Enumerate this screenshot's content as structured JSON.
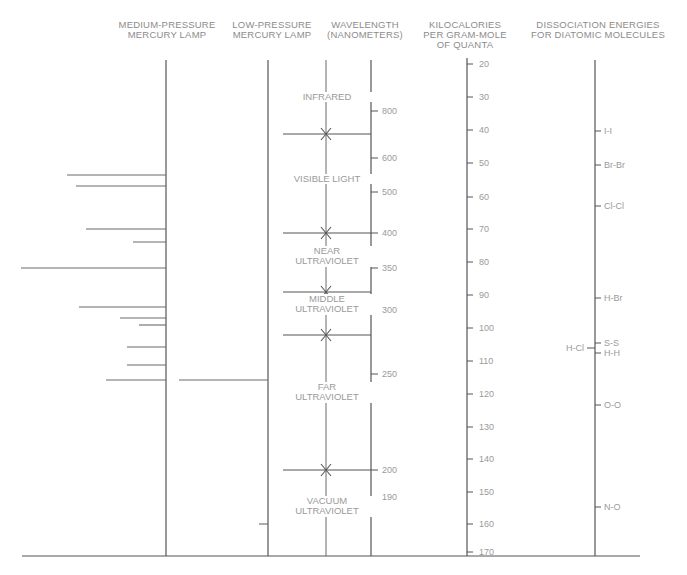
{
  "headers": {
    "medium_pressure": "MEDIUM-PRESSURE\nMERCURY LAMP",
    "low_pressure": "LOW-PRESSURE\nMERCURY LAMP",
    "wavelength": "WAVELENGTH\n(NANOMETERS)",
    "kilocalories": "KILOCALORIES\nPER GRAM-MOLE\nOF QUANTA",
    "dissociation": "DISSOCIATION ENERGIES\nFOR DIATOMIC MOLECULES"
  },
  "regions": [
    {
      "label": "INFRARED",
      "y": 97
    },
    {
      "label": "VISIBLE LIGHT",
      "y": 179
    },
    {
      "label": "NEAR\nULTRAVIOLET",
      "y": 256
    },
    {
      "label": "MIDDLE\nULTRAVIOLET",
      "y": 304
    },
    {
      "label": "FAR\nULTRAVIOLET",
      "y": 392
    },
    {
      "label": "VACUUM\nULTRAVIOLET",
      "y": 506
    }
  ],
  "region_boundaries_y": [
    134,
    233,
    292,
    335,
    470
  ],
  "chart_data": {
    "type": "diagram",
    "wavelength_axis": {
      "label": "WAVELENGTH (NANOMETERS)",
      "ticks": [
        {
          "value": 800,
          "y": 111
        },
        {
          "value": 600,
          "y": 158
        },
        {
          "value": 500,
          "y": 192
        },
        {
          "value": 400,
          "y": 233
        },
        {
          "value": 350,
          "y": 268
        },
        {
          "value": 300,
          "y": 310
        },
        {
          "value": 250,
          "y": 374
        },
        {
          "value": 200,
          "y": 470
        },
        {
          "value": 190,
          "y": 497
        }
      ]
    },
    "energy_axis": {
      "label": "KILOCALORIES PER GRAM-MOLE OF QUANTA",
      "ticks": [
        {
          "value": 20,
          "y": 64
        },
        {
          "value": 30,
          "y": 97
        },
        {
          "value": 40,
          "y": 130
        },
        {
          "value": 50,
          "y": 163
        },
        {
          "value": 60,
          "y": 197
        },
        {
          "value": 70,
          "y": 229
        },
        {
          "value": 80,
          "y": 262
        },
        {
          "value": 90,
          "y": 295
        },
        {
          "value": 100,
          "y": 328
        },
        {
          "value": 110,
          "y": 361
        },
        {
          "value": 120,
          "y": 394
        },
        {
          "value": 130,
          "y": 427
        },
        {
          "value": 140,
          "y": 459
        },
        {
          "value": 150,
          "y": 492
        },
        {
          "value": 160,
          "y": 524
        },
        {
          "value": 170,
          "y": 552
        }
      ]
    },
    "dissociation_energies": [
      {
        "molecule": "I-I",
        "kcal": 36,
        "y": 131,
        "side": "right"
      },
      {
        "molecule": "Br-Br",
        "kcal": 46,
        "y": 165,
        "side": "right"
      },
      {
        "molecule": "Cl-Cl",
        "kcal": 58,
        "y": 206,
        "side": "right"
      },
      {
        "molecule": "H-Br",
        "kcal": 87,
        "y": 298,
        "side": "right"
      },
      {
        "molecule": "S-S",
        "kcal": 101,
        "y": 343,
        "side": "right"
      },
      {
        "molecule": "H-Cl",
        "kcal": 103,
        "y": 348,
        "side": "left"
      },
      {
        "molecule": "H-H",
        "kcal": 104,
        "y": 353,
        "side": "right"
      },
      {
        "molecule": "O-O",
        "kcal": 119,
        "y": 405,
        "side": "right"
      },
      {
        "molecule": "N-O",
        "kcal": 150,
        "y": 507,
        "side": "right"
      }
    ],
    "medium_pressure_lines": [
      {
        "y": 175,
        "x_start": 67
      },
      {
        "y": 186,
        "x_start": 76
      },
      {
        "y": 229,
        "x_start": 86
      },
      {
        "y": 242,
        "x_start": 133
      },
      {
        "y": 268,
        "x_start": 21
      },
      {
        "y": 307,
        "x_start": 79
      },
      {
        "y": 318,
        "x_start": 120
      },
      {
        "y": 325,
        "x_start": 139
      },
      {
        "y": 347,
        "x_start": 127
      },
      {
        "y": 365,
        "x_start": 127
      },
      {
        "y": 380,
        "x_start": 106
      }
    ],
    "low_pressure_lines": [
      {
        "y": 380,
        "x_start": 179
      },
      {
        "y": 524,
        "x_start": 259
      }
    ]
  }
}
